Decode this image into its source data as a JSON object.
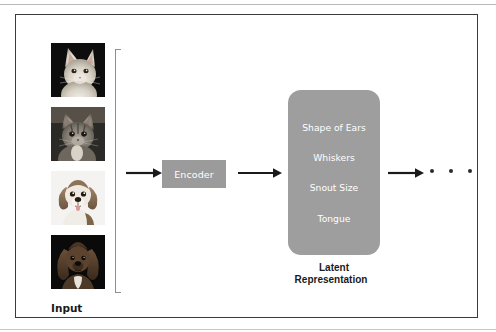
{
  "figure": {
    "input": {
      "caption": "Input",
      "images": [
        {
          "name": "white-cat-photo",
          "alt": "White cat on dark background"
        },
        {
          "name": "tabby-cat-photo",
          "alt": "Tabby cat on dark background"
        },
        {
          "name": "beagle-puppy-photo",
          "alt": "Beagle puppy on white background"
        },
        {
          "name": "dark-setter-dog-photo",
          "alt": "Dark long-haired dog on black background"
        }
      ]
    },
    "encoder": {
      "label": "Encoder",
      "fill": "#9b9b9b",
      "text_color": "#ffffff"
    },
    "latent": {
      "caption_line1": "Latent",
      "caption_line2": "Representation",
      "fill": "#9e9e9e",
      "text_color": "#ffffff",
      "features": [
        "Shape of Ears",
        "Whiskers",
        "Snout Size",
        "Tongue"
      ]
    },
    "flow": {
      "arrows": [
        {
          "name": "arrow-input-to-encoder"
        },
        {
          "name": "arrow-encoder-to-latent"
        },
        {
          "name": "arrow-latent-to-next"
        }
      ],
      "continuation": "•  •  •"
    },
    "colors": {
      "frame_border": "#3b3b3b",
      "bracket": "#8f8f8f",
      "arrow": "#1a1a1a",
      "background": "#ffffff"
    }
  }
}
